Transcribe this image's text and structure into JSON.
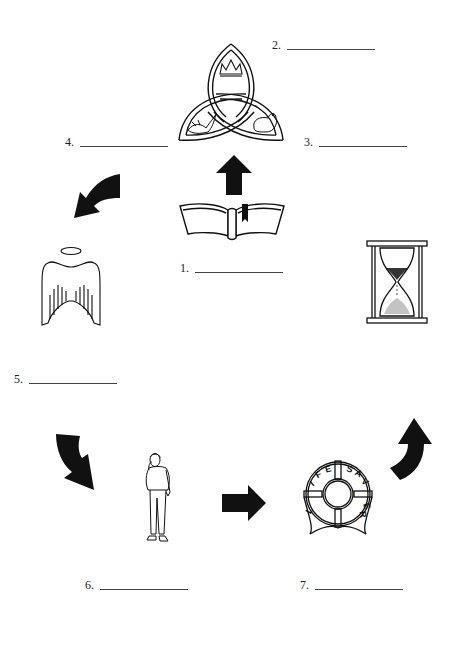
{
  "worksheet": {
    "labels": [
      {
        "id": "1",
        "text": "1.",
        "blank": ""
      },
      {
        "id": "2",
        "text": "2.",
        "blank": ""
      },
      {
        "id": "3",
        "text": "3.",
        "blank": ""
      },
      {
        "id": "4",
        "text": "4.",
        "blank": ""
      },
      {
        "id": "5",
        "text": "5.",
        "blank": ""
      },
      {
        "id": "6",
        "text": "6.",
        "blank": ""
      },
      {
        "id": "7",
        "text": "7.",
        "blank": ""
      }
    ],
    "images": {
      "trinity_knot": {
        "icon": "trinity-knot-icon",
        "contains": [
          "crown",
          "dove",
          "lamb"
        ]
      },
      "bible": {
        "icon": "open-bible-icon"
      },
      "angel_wings": {
        "icon": "angel-wings-halo-icon"
      },
      "hourglass": {
        "icon": "hourglass-icon"
      },
      "person": {
        "icon": "standing-person-icon"
      },
      "life_saver": {
        "icon": "life-saver-icon",
        "text_top_left": "LIFE",
        "text_top_right": "SAVER"
      }
    },
    "arrows": [
      {
        "name": "arrow-up",
        "direction": "up"
      },
      {
        "name": "arrow-curved-down-left",
        "direction": "down-left"
      },
      {
        "name": "arrow-curved-down-right",
        "direction": "down-right"
      },
      {
        "name": "arrow-right",
        "direction": "right"
      },
      {
        "name": "arrow-curved-up-right",
        "direction": "up-right"
      }
    ],
    "colors": {
      "ink": "#111111",
      "paper": "#ffffff",
      "line": "#444444"
    }
  }
}
